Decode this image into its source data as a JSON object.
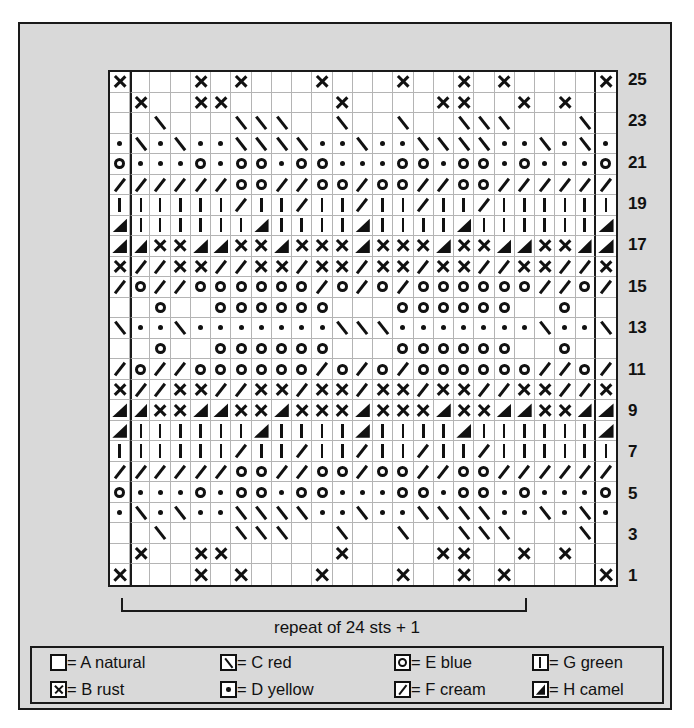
{
  "chart_data": {
    "type": "heatmap",
    "columns": 25,
    "rows": 25,
    "xlabel": "stitches",
    "ylabel": "rows",
    "grid": true,
    "legend_position": "bottom",
    "row_numbers": [
      25,
      23,
      21,
      19,
      17,
      15,
      13,
      11,
      9,
      7,
      5,
      3,
      1
    ],
    "repeat_note": "repeat of 24 sts + 1",
    "repeat_columns": [
      2,
      24
    ],
    "symbol_key": {
      "A": "blank",
      "B": "cross-x",
      "C": "backslash",
      "D": "dot",
      "E": "open-circle",
      "F": "forward-slash",
      "G": "vertical-bar",
      "H": "filled-triangle"
    },
    "legend_entries": [
      {
        "symbol": "A",
        "letter": "A",
        "color_name": "natural"
      },
      {
        "symbol": "C",
        "letter": "C",
        "color_name": "red"
      },
      {
        "symbol": "E",
        "letter": "E",
        "color_name": "blue"
      },
      {
        "symbol": "G",
        "letter": "G",
        "color_name": "green"
      },
      {
        "symbol": "B",
        "letter": "B",
        "color_name": "rust"
      },
      {
        "symbol": "D",
        "letter": "D",
        "color_name": "yellow"
      },
      {
        "symbol": "F",
        "letter": "F",
        "color_name": "cream"
      },
      {
        "symbol": "H",
        "letter": "H",
        "color_name": "camel"
      }
    ],
    "rows_data": [
      {
        "row": 25,
        "cells": [
          "B",
          "A",
          "A",
          "A",
          "B",
          "A",
          "B",
          "A",
          "A",
          "A",
          "B",
          "A",
          "A",
          "A",
          "B",
          "A",
          "A",
          "B",
          "A",
          "B",
          "A",
          "A",
          "A",
          "A",
          "B"
        ]
      },
      {
        "row": 24,
        "cells": [
          "A",
          "B",
          "A",
          "A",
          "B",
          "B",
          "A",
          "A",
          "A",
          "A",
          "A",
          "B",
          "A",
          "A",
          "A",
          "A",
          "B",
          "B",
          "A",
          "A",
          "B",
          "A",
          "B",
          "A",
          "A"
        ]
      },
      {
        "row": 23,
        "cells": [
          "A",
          "A",
          "C",
          "A",
          "A",
          "A",
          "C",
          "C",
          "C",
          "A",
          "A",
          "C",
          "A",
          "A",
          "C",
          "A",
          "A",
          "C",
          "C",
          "C",
          "A",
          "A",
          "A",
          "C",
          "A"
        ]
      },
      {
        "row": 22,
        "cells": [
          "D",
          "C",
          "D",
          "C",
          "D",
          "D",
          "C",
          "C",
          "C",
          "C",
          "D",
          "D",
          "C",
          "D",
          "D",
          "C",
          "C",
          "C",
          "C",
          "D",
          "D",
          "C",
          "D",
          "C",
          "D"
        ]
      },
      {
        "row": 21,
        "cells": [
          "E",
          "D",
          "D",
          "D",
          "E",
          "D",
          "E",
          "E",
          "D",
          "E",
          "E",
          "D",
          "D",
          "D",
          "E",
          "E",
          "D",
          "E",
          "E",
          "D",
          "E",
          "D",
          "D",
          "D",
          "E"
        ]
      },
      {
        "row": 20,
        "cells": [
          "F",
          "F",
          "F",
          "F",
          "F",
          "F",
          "E",
          "E",
          "F",
          "F",
          "E",
          "E",
          "F",
          "E",
          "E",
          "F",
          "F",
          "E",
          "E",
          "F",
          "F",
          "F",
          "F",
          "F",
          "F"
        ]
      },
      {
        "row": 19,
        "cells": [
          "G",
          "G",
          "G",
          "G",
          "G",
          "G",
          "F",
          "G",
          "G",
          "F",
          "G",
          "G",
          "F",
          "G",
          "G",
          "F",
          "G",
          "G",
          "F",
          "G",
          "G",
          "G",
          "G",
          "G",
          "G"
        ]
      },
      {
        "row": 18,
        "cells": [
          "H",
          "G",
          "G",
          "G",
          "G",
          "G",
          "G",
          "H",
          "G",
          "G",
          "G",
          "G",
          "H",
          "G",
          "G",
          "G",
          "G",
          "H",
          "G",
          "G",
          "G",
          "G",
          "G",
          "G",
          "H"
        ]
      },
      {
        "row": 17,
        "cells": [
          "H",
          "H",
          "B",
          "B",
          "H",
          "H",
          "B",
          "B",
          "H",
          "B",
          "B",
          "B",
          "H",
          "B",
          "B",
          "B",
          "H",
          "B",
          "B",
          "H",
          "H",
          "B",
          "B",
          "H",
          "H"
        ]
      },
      {
        "row": 16,
        "cells": [
          "B",
          "F",
          "F",
          "B",
          "B",
          "F",
          "F",
          "B",
          "B",
          "F",
          "B",
          "B",
          "F",
          "B",
          "B",
          "F",
          "B",
          "B",
          "F",
          "F",
          "B",
          "B",
          "F",
          "F",
          "B"
        ]
      },
      {
        "row": 15,
        "cells": [
          "F",
          "E",
          "F",
          "F",
          "E",
          "E",
          "E",
          "E",
          "E",
          "E",
          "F",
          "E",
          "F",
          "E",
          "F",
          "E",
          "E",
          "E",
          "E",
          "E",
          "E",
          "F",
          "F",
          "E",
          "F"
        ]
      },
      {
        "row": 14,
        "cells": [
          "A",
          "A",
          "E",
          "A",
          "A",
          "E",
          "E",
          "E",
          "E",
          "E",
          "E",
          "A",
          "A",
          "A",
          "E",
          "E",
          "E",
          "E",
          "E",
          "E",
          "A",
          "A",
          "E",
          "A",
          "A"
        ]
      },
      {
        "row": 13,
        "cells": [
          "C",
          "D",
          "D",
          "C",
          "D",
          "D",
          "D",
          "D",
          "D",
          "D",
          "D",
          "C",
          "C",
          "C",
          "D",
          "D",
          "D",
          "D",
          "D",
          "D",
          "D",
          "C",
          "D",
          "D",
          "C"
        ]
      },
      {
        "row": 12,
        "cells": [
          "A",
          "A",
          "E",
          "A",
          "A",
          "E",
          "E",
          "E",
          "E",
          "E",
          "E",
          "A",
          "A",
          "A",
          "E",
          "E",
          "E",
          "E",
          "E",
          "E",
          "A",
          "A",
          "E",
          "A",
          "A"
        ]
      },
      {
        "row": 11,
        "cells": [
          "F",
          "E",
          "F",
          "F",
          "E",
          "E",
          "E",
          "E",
          "E",
          "E",
          "F",
          "E",
          "F",
          "E",
          "F",
          "E",
          "E",
          "E",
          "E",
          "E",
          "E",
          "F",
          "F",
          "E",
          "F"
        ]
      },
      {
        "row": 10,
        "cells": [
          "B",
          "F",
          "F",
          "B",
          "B",
          "F",
          "F",
          "B",
          "B",
          "F",
          "B",
          "B",
          "F",
          "B",
          "B",
          "F",
          "B",
          "B",
          "F",
          "F",
          "B",
          "B",
          "F",
          "F",
          "B"
        ]
      },
      {
        "row": 9,
        "cells": [
          "H",
          "H",
          "B",
          "B",
          "H",
          "H",
          "B",
          "B",
          "H",
          "B",
          "B",
          "B",
          "H",
          "B",
          "B",
          "B",
          "H",
          "B",
          "B",
          "H",
          "H",
          "B",
          "B",
          "H",
          "H"
        ]
      },
      {
        "row": 8,
        "cells": [
          "H",
          "G",
          "G",
          "G",
          "G",
          "G",
          "G",
          "H",
          "G",
          "G",
          "G",
          "G",
          "H",
          "G",
          "G",
          "G",
          "G",
          "H",
          "G",
          "G",
          "G",
          "G",
          "G",
          "G",
          "H"
        ]
      },
      {
        "row": 7,
        "cells": [
          "G",
          "G",
          "G",
          "G",
          "G",
          "G",
          "F",
          "G",
          "G",
          "F",
          "G",
          "G",
          "F",
          "G",
          "G",
          "F",
          "G",
          "G",
          "F",
          "G",
          "G",
          "G",
          "G",
          "G",
          "G"
        ]
      },
      {
        "row": 6,
        "cells": [
          "F",
          "F",
          "F",
          "F",
          "F",
          "F",
          "E",
          "E",
          "F",
          "F",
          "E",
          "E",
          "F",
          "E",
          "E",
          "F",
          "F",
          "E",
          "E",
          "F",
          "F",
          "F",
          "F",
          "F",
          "F"
        ]
      },
      {
        "row": 5,
        "cells": [
          "E",
          "D",
          "D",
          "D",
          "E",
          "D",
          "E",
          "E",
          "D",
          "E",
          "E",
          "D",
          "D",
          "D",
          "E",
          "E",
          "D",
          "E",
          "E",
          "D",
          "E",
          "D",
          "D",
          "D",
          "E"
        ]
      },
      {
        "row": 4,
        "cells": [
          "D",
          "C",
          "D",
          "C",
          "D",
          "D",
          "C",
          "C",
          "C",
          "C",
          "D",
          "D",
          "C",
          "D",
          "D",
          "C",
          "C",
          "C",
          "C",
          "D",
          "D",
          "C",
          "D",
          "C",
          "D"
        ]
      },
      {
        "row": 3,
        "cells": [
          "A",
          "A",
          "C",
          "A",
          "A",
          "A",
          "C",
          "C",
          "C",
          "A",
          "A",
          "C",
          "A",
          "A",
          "C",
          "A",
          "A",
          "C",
          "C",
          "C",
          "A",
          "A",
          "A",
          "C",
          "A"
        ]
      },
      {
        "row": 2,
        "cells": [
          "A",
          "B",
          "A",
          "A",
          "B",
          "B",
          "A",
          "A",
          "A",
          "A",
          "A",
          "B",
          "A",
          "A",
          "A",
          "A",
          "B",
          "B",
          "A",
          "A",
          "B",
          "A",
          "B",
          "A",
          "A"
        ]
      },
      {
        "row": 1,
        "cells": [
          "B",
          "A",
          "A",
          "A",
          "B",
          "A",
          "B",
          "A",
          "A",
          "A",
          "B",
          "A",
          "A",
          "A",
          "B",
          "A",
          "A",
          "B",
          "A",
          "B",
          "A",
          "A",
          "A",
          "A",
          "B"
        ]
      }
    ]
  },
  "repeat": {
    "label": "repeat of 24 sts + 1"
  },
  "legend": {
    "row1": [
      {
        "key": "A",
        "text": "= A natural"
      },
      {
        "key": "C",
        "text": "= C red"
      },
      {
        "key": "E",
        "text": "= E blue"
      },
      {
        "key": "G",
        "text": "= G green"
      }
    ],
    "row2": [
      {
        "key": "B",
        "text": "= B rust"
      },
      {
        "key": "D",
        "text": "= D yellow"
      },
      {
        "key": "F",
        "text": "= F cream"
      },
      {
        "key": "H",
        "text": "= H camel"
      }
    ]
  }
}
